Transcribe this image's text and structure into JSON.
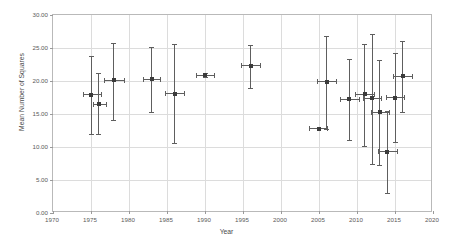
{
  "chart_data": {
    "type": "scatter",
    "title": "",
    "xlabel": "Year",
    "ylabel": "Mean Number of Squares",
    "xlim": [
      1970,
      2020
    ],
    "ylim": [
      0.0,
      30.0
    ],
    "xticks": [
      "1970",
      "1975",
      "1980",
      "1985",
      "1990",
      "1995",
      "2000",
      "2005",
      "2010",
      "2015",
      "2020"
    ],
    "xtick_values": [
      1970,
      1975,
      1980,
      1985,
      1990,
      1995,
      2000,
      2005,
      2010,
      2015,
      2020
    ],
    "yticks": [
      "0.00",
      "5.00",
      "10.00",
      "15.00",
      "20.00",
      "25.00",
      "30.00"
    ],
    "ytick_values": [
      0,
      5,
      10,
      15,
      20,
      25,
      30
    ],
    "grid": true,
    "legend": false,
    "marker_color": "#3b3b3b",
    "errorbar_color": "#5e5e5e",
    "series": [
      {
        "name": "Mean Number of Squares",
        "points": [
          {
            "x": 1975.0,
            "y": 17.9,
            "yerr_low": 11.9,
            "yerr_high": 23.8,
            "xerr_low": 1974.0,
            "xerr_high": 1976.3
          },
          {
            "x": 1976.0,
            "y": 16.5,
            "yerr_low": 11.9,
            "yerr_high": 21.2,
            "xerr_low": 1975.2,
            "xerr_high": 1977.0
          },
          {
            "x": 1978.0,
            "y": 20.1,
            "yerr_low": 14.1,
            "yerr_high": 25.8,
            "xerr_low": 1976.7,
            "xerr_high": 1979.3
          },
          {
            "x": 1983.0,
            "y": 20.3,
            "yerr_low": 15.3,
            "yerr_high": 25.1,
            "xerr_low": 1981.9,
            "xerr_high": 1984.1
          },
          {
            "x": 1986.0,
            "y": 18.1,
            "yerr_low": 10.6,
            "yerr_high": 25.6,
            "xerr_low": 1984.7,
            "xerr_high": 1987.3
          },
          {
            "x": 1990.0,
            "y": 20.9,
            "yerr_low": 20.6,
            "yerr_high": 21.2,
            "xerr_low": 1988.8,
            "xerr_high": 1991.2
          },
          {
            "x": 1996.0,
            "y": 22.3,
            "yerr_low": 19.0,
            "yerr_high": 25.4,
            "xerr_low": 1994.7,
            "xerr_high": 1997.2
          },
          {
            "x": 2005.0,
            "y": 12.8,
            "yerr_low": 12.8,
            "yerr_high": 12.8,
            "xerr_low": 2003.7,
            "xerr_high": 2006.1
          },
          {
            "x": 2006.0,
            "y": 19.9,
            "yerr_low": 12.8,
            "yerr_high": 26.8,
            "xerr_low": 2004.8,
            "xerr_high": 2007.2
          },
          {
            "x": 2009.0,
            "y": 17.2,
            "yerr_low": 11.0,
            "yerr_high": 23.4,
            "xerr_low": 2007.8,
            "xerr_high": 2010.2
          },
          {
            "x": 2011.0,
            "y": 18.0,
            "yerr_low": 10.2,
            "yerr_high": 25.6,
            "xerr_low": 2009.8,
            "xerr_high": 2012.3
          },
          {
            "x": 2012.0,
            "y": 17.4,
            "yerr_low": 7.4,
            "yerr_high": 27.1,
            "xerr_low": 2010.8,
            "xerr_high": 2013.2
          },
          {
            "x": 2013.0,
            "y": 15.3,
            "yerr_low": 7.3,
            "yerr_high": 23.2,
            "xerr_low": 2011.8,
            "xerr_high": 2014.2
          },
          {
            "x": 2014.0,
            "y": 9.3,
            "yerr_low": 3.1,
            "yerr_high": 15.4,
            "xerr_low": 2012.8,
            "xerr_high": 2015.2
          },
          {
            "x": 2015.0,
            "y": 17.5,
            "yerr_low": 10.8,
            "yerr_high": 24.3,
            "xerr_low": 2013.8,
            "xerr_high": 2016.2
          },
          {
            "x": 2016.0,
            "y": 20.7,
            "yerr_low": 15.3,
            "yerr_high": 26.1,
            "xerr_low": 2014.8,
            "xerr_high": 2017.2
          }
        ]
      }
    ]
  }
}
